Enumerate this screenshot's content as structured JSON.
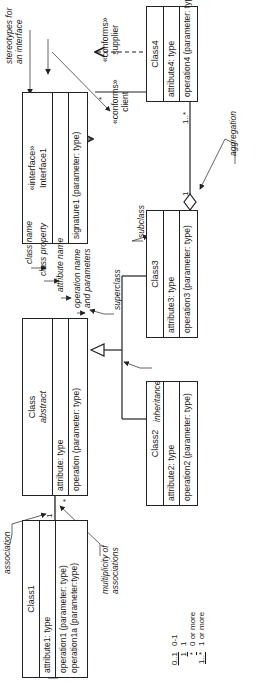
{
  "classes": {
    "class1": {
      "name": "Class1",
      "attribute": "attribute1: type",
      "operations": [
        "operation1 (parameter: type)",
        "operation1a (parameter:type)"
      ]
    },
    "class": {
      "name": "Class",
      "stereo": "abstract",
      "attribute": "attribute: type",
      "operation": "operation (parameter: type)"
    },
    "interface1": {
      "stereo": "«interface»",
      "name": "Interface1",
      "operation": "signature1 (parameter: type)"
    },
    "class2": {
      "name": "Class2",
      "attribute": "attribute2: type",
      "operation": "operation2 (parameter: type)"
    },
    "class3": {
      "name": "Class3",
      "attribute": "attribute3: type",
      "operation": "operation3 (parameter: type)"
    },
    "class4": {
      "name": "Class4",
      "attribute": "attribute4: type",
      "operation": "operation4 (parameter: type)"
    },
    "class5": {
      "name": "Class5",
      "attribute": "attribute5: type",
      "operation": "operation5 (parameter: type)"
    }
  },
  "annotations": {
    "association": "association",
    "multiplicity": [
      "multiplicity of",
      "associations"
    ],
    "class_name": "class name",
    "class_property": "class property",
    "attribute_name": "attribute name",
    "operation_name": [
      "operation name",
      "and parameters"
    ],
    "superclass": "superclass",
    "subclass": "subclass",
    "inheritance": "inheritance",
    "aggregation": "aggregation",
    "stereotypes": [
      "stereotypes for",
      "an interface"
    ]
  },
  "relationships": {
    "conforms_client": [
      "«conforms»",
      "client"
    ],
    "conforms_supplier": [
      "«conforms»",
      "supplier"
    ],
    "mult_class1": "1",
    "mult_class": "*",
    "mult_interface": "*",
    "mult_class4": "1..*",
    "mult_class3": "1"
  },
  "legend": [
    {
      "symbol": "0..1",
      "meaning": "0-1"
    },
    {
      "symbol": "1",
      "meaning": "1"
    },
    {
      "symbol": "*",
      "meaning": "0 or more"
    },
    {
      "symbol": "1..*",
      "meaning": "1 or more"
    }
  ]
}
